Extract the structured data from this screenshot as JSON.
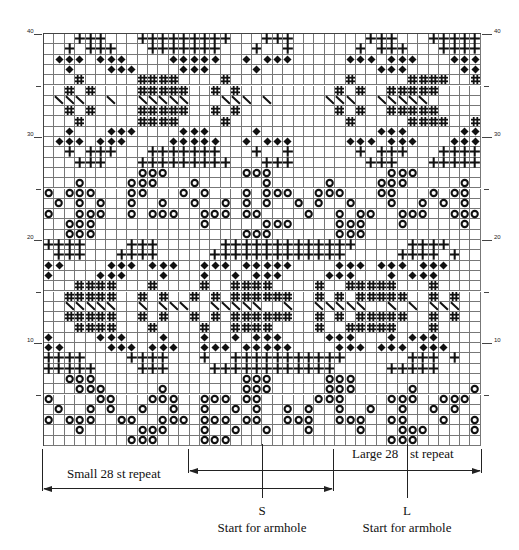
{
  "chart_data": {
    "type": "table",
    "columns": 42,
    "rows": 40,
    "legend_symbols": {
      ".": "blank",
      "D": "diamond",
      "P": "cross",
      "H": "hash",
      "S": "slash",
      "O": "ring"
    },
    "row_labels": [
      {
        "row": 40,
        "label": "40"
      },
      {
        "row": 30,
        "label": "30"
      },
      {
        "row": 20,
        "label": "20"
      },
      {
        "row": 10,
        "label": "10"
      }
    ],
    "grid": [
      "...PPP...PPPPPPPPP...PPP.......PPP...PPPPP",
      "..P.PPP...PPPPPPP...P..P......P.PPP...PPPP",
      ".DDD.DDD....DDDDD..D.DDD.....DDD.DDD...DDD",
      "..D...DDD....DDD....D...........DDD.....DD",
      "...H.....HHHH....H...........H.....HHHH..H",
      "..H.H....HHHHH..H.H.........H.H..HHHHH...",
      ".SSS..S..SSSSS...SSS.S.....SSS..SSSSS....",
      "..H.H....HHHHH..H.H.........H.H..HHHHH...",
      "...H.....HHHH....H...........H.....HHHH..H",
      "..D...DDD....DDD....D...........DDD.....DD",
      ".DDD.DDD....DDDDD..D.DDD.....DDD.DDD...DDD",
      "..P.PPP...PPPPPPP...P..P......P.PPP...PPPP",
      "...PPP...PPPPPPPPP...PPP.......PPP...PPPPP",
      ".........OOO.......OOO...........OOO......",
      "...O....OOO...O......O.....O....OOO.....O.",
      "O.OOO...OO...O.O...O.OOO..OOO...OO...O.OO.",
      ".O.O.O..O..O..O..O.O.O..O.O..O...O..O.O.O.",
      "O..OOO..O.OOO..OOO.OO....O..O.OO..OOO..OOO",
      "..OOO..........O.....OOO....OOO...O.....O.",
      "..OOO..............OOO......OOO...........",
      "PPPP....PPP......PPPPPPPPPPPPP.....PPPP....",
      ".PPP...PPPP.....PPPPPPPPPPPPP.....PPPP.P..",
      "DD....DDD.DDD..DDD.DDDDD....DDD.DDD.DDD...",
      "D....DDD...D...D..D.DDD....DDD...D.DDD....",
      "...HHHH...H....H..HHHH....H..HHHHH...H....",
      "..HHHHH..H.H..H.H.HHHHHH..H.H.HHHHH..H.H..",
      "..SSSSS..S.SSS..SSSSS..S..SSSSS..S.S.SSS..",
      "..HHHHH..H.H..H.H.HHHHHH..H.H.HHHHH..H.H..",
      "...HHHH...H....H..HHHH....H..HHHHH...H....",
      "D....DDD...D...D..D.DDD....DDD...D.DDD....",
      "DD....DDD.DDD..DDD.DDDDD....DDD.DDD.DDD...",
      "PPPP....PPPP...P..PPPPPPPPPPP......PPP.P..",
      "PPPPP....PPP....PPPPPPPPPPPP.....PPPPP...",
      "..OOO..............OOO.....OOO...........",
      "...OOO.....O.......OOO.....OOO.....O.....O",
      "O....OO...OOO..OOO.OO.....OOO....OOO..OOO",
      ".O..O.O..O..O..O..O.O..O.O..O..O..O..O.O.",
      "O.OOO..OO..OOO.OOO.OO..OOO..OOO..OO...O..O",
      "...O.....OOO...O..O..O...O....O...OOO....O",
      "........OOO....OOO...............OOO......"
    ]
  },
  "annotations": {
    "small_repeat": "Small 28 st repeat",
    "large_repeat_part1": "Large 28",
    "large_repeat_part2": "st repeat",
    "small_marker": "S",
    "large_marker": "L",
    "small_start": "Start for armhole",
    "large_start": "Start for armhole"
  }
}
